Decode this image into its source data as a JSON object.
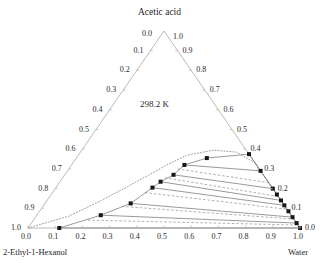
{
  "figure": {
    "type": "ternary-phase-diagram",
    "temperature_label": "298.2 K",
    "apex_label": "Acetic acid",
    "left_corner_label": "2-Ethyl-1-Hexanol",
    "right_corner_label": "Water",
    "apex_tick_left": "0.0",
    "apex_tick_right": "1.0"
  },
  "axes": {
    "left_axis_name": "Acetic acid fraction (left edge)",
    "right_axis_name": "Acetic acid fraction (right edge)",
    "bottom_axis_name": "Water fraction",
    "left_ticks": [
      "0.1",
      "0.2",
      "0.3",
      "0.4",
      "0.5",
      "0.6",
      "0.7",
      "0.8",
      "0.9",
      "1.0"
    ],
    "right_ticks": [
      "0.9",
      "0.8",
      "0.7",
      "0.6",
      "0.5",
      "0.4",
      "0.3",
      "0.2",
      "0.1",
      "0.0"
    ],
    "bottom_ticks": [
      "0.0",
      "0.1",
      "0.2",
      "0.3",
      "0.4",
      "0.5",
      "0.6",
      "0.7",
      "0.8",
      "0.9",
      "1.0"
    ]
  },
  "chart_data": {
    "type": "scatter",
    "title": "",
    "subtitle": "298.2 K",
    "xlabel": "2-Ethyl-1-Hexanol",
    "ylabel": "Acetic acid",
    "zlabel": "Water",
    "components": [
      "2-Ethyl-1-Hexanol",
      "Acetic acid",
      "Water"
    ],
    "axis_range": [
      0.0,
      1.0
    ],
    "grid": false,
    "legend_position": "none",
    "series": [
      {
        "name": "Experimental binodal (left / organic branch)",
        "marker": "filled-square",
        "points": [
          {
            "alcohol": 0.885,
            "acid": 0.0,
            "water": 0.115
          },
          {
            "alcohol": 0.7,
            "acid": 0.065,
            "water": 0.235
          },
          {
            "alcohol": 0.56,
            "acid": 0.125,
            "water": 0.315
          },
          {
            "alcohol": 0.44,
            "acid": 0.205,
            "water": 0.355
          },
          {
            "alcohol": 0.395,
            "acid": 0.235,
            "water": 0.37
          },
          {
            "alcohol": 0.33,
            "acid": 0.27,
            "water": 0.4
          },
          {
            "alcohol": 0.265,
            "acid": 0.32,
            "water": 0.415
          },
          {
            "alcohol": 0.165,
            "acid": 0.355,
            "water": 0.48
          },
          {
            "alcohol": 0.0,
            "acid": 0.375,
            "water": 0.625
          }
        ]
      },
      {
        "name": "Experimental binodal (right / aqueous branch)",
        "marker": "filled-square",
        "points": [
          {
            "alcohol": 0.0,
            "acid": 0.29,
            "water": 0.71
          },
          {
            "alcohol": 0.0,
            "acid": 0.2,
            "water": 0.8
          },
          {
            "alcohol": 0.0,
            "acid": 0.17,
            "water": 0.83
          },
          {
            "alcohol": 0.0,
            "acid": 0.14,
            "water": 0.86
          },
          {
            "alcohol": 0.0,
            "acid": 0.115,
            "water": 0.885
          },
          {
            "alcohol": 0.0,
            "acid": 0.085,
            "water": 0.915
          },
          {
            "alcohol": 0.0,
            "acid": 0.055,
            "water": 0.945
          },
          {
            "alcohol": 0.0,
            "acid": 0.025,
            "water": 0.975
          },
          {
            "alcohol": 0.0,
            "acid": 0.0,
            "water": 1.0
          }
        ]
      }
    ],
    "tie_lines_experimental": [
      {
        "style": "solid",
        "left": {
          "alcohol": 0.885,
          "acid": 0.0,
          "water": 0.115
        },
        "right": {
          "alcohol": 0.0,
          "acid": 0.0,
          "water": 1.0
        }
      },
      {
        "style": "solid",
        "left": {
          "alcohol": 0.7,
          "acid": 0.065,
          "water": 0.235
        },
        "right": {
          "alcohol": 0.0,
          "acid": 0.025,
          "water": 0.975
        }
      },
      {
        "style": "solid",
        "left": {
          "alcohol": 0.56,
          "acid": 0.125,
          "water": 0.315
        },
        "right": {
          "alcohol": 0.0,
          "acid": 0.055,
          "water": 0.945
        }
      },
      {
        "style": "solid",
        "left": {
          "alcohol": 0.44,
          "acid": 0.205,
          "water": 0.355
        },
        "right": {
          "alcohol": 0.0,
          "acid": 0.115,
          "water": 0.885
        }
      },
      {
        "style": "solid",
        "left": {
          "alcohol": 0.395,
          "acid": 0.235,
          "water": 0.37
        },
        "right": {
          "alcohol": 0.0,
          "acid": 0.14,
          "water": 0.86
        }
      },
      {
        "style": "solid",
        "left": {
          "alcohol": 0.33,
          "acid": 0.27,
          "water": 0.4
        },
        "right": {
          "alcohol": 0.0,
          "acid": 0.2,
          "water": 0.8
        }
      },
      {
        "style": "solid",
        "left": {
          "alcohol": 0.265,
          "acid": 0.32,
          "water": 0.415
        },
        "right": {
          "alcohol": 0.0,
          "acid": 0.29,
          "water": 0.71
        }
      }
    ],
    "tie_lines_calculated": [
      {
        "style": "dashed",
        "left": {
          "alcohol": 0.76,
          "acid": 0.04,
          "water": 0.2
        },
        "right": {
          "alcohol": 0.0,
          "acid": 0.015,
          "water": 0.985
        }
      },
      {
        "style": "dashed",
        "left": {
          "alcohol": 0.6,
          "acid": 0.11,
          "water": 0.29
        },
        "right": {
          "alcohol": 0.0,
          "acid": 0.045,
          "water": 0.955
        }
      },
      {
        "style": "dashed",
        "left": {
          "alcohol": 0.48,
          "acid": 0.18,
          "water": 0.34
        },
        "right": {
          "alcohol": 0.0,
          "acid": 0.095,
          "water": 0.905
        }
      },
      {
        "style": "dashed",
        "left": {
          "alcohol": 0.37,
          "acid": 0.255,
          "water": 0.375
        },
        "right": {
          "alcohol": 0.0,
          "acid": 0.16,
          "water": 0.84
        }
      },
      {
        "style": "dashed",
        "left": {
          "alcohol": 0.3,
          "acid": 0.3,
          "water": 0.4
        },
        "right": {
          "alcohol": 0.0,
          "acid": 0.23,
          "water": 0.77
        }
      }
    ],
    "binodal_calculated": {
      "name": "Calculated binodal curve",
      "style": "dotted",
      "points": [
        {
          "alcohol": 1.0,
          "acid": 0.0,
          "water": 0.0
        },
        {
          "alcohol": 0.82,
          "acid": 0.06,
          "water": 0.12
        },
        {
          "alcohol": 0.66,
          "acid": 0.14,
          "water": 0.2
        },
        {
          "alcohol": 0.52,
          "acid": 0.215,
          "water": 0.265
        },
        {
          "alcohol": 0.42,
          "acid": 0.27,
          "water": 0.31
        },
        {
          "alcohol": 0.33,
          "acid": 0.32,
          "water": 0.35
        },
        {
          "alcohol": 0.23,
          "acid": 0.37,
          "water": 0.4
        },
        {
          "alcohol": 0.12,
          "acid": 0.395,
          "water": 0.485
        },
        {
          "alcohol": 0.04,
          "acid": 0.385,
          "water": 0.575
        },
        {
          "alcohol": 0.0,
          "acid": 0.33,
          "water": 0.67
        },
        {
          "alcohol": 0.0,
          "acid": 0.24,
          "water": 0.76
        },
        {
          "alcohol": 0.0,
          "acid": 0.15,
          "water": 0.85
        },
        {
          "alcohol": 0.0,
          "acid": 0.07,
          "water": 0.93
        },
        {
          "alcohol": 0.0,
          "acid": 0.0,
          "water": 1.0
        }
      ]
    }
  },
  "style": {
    "axis_color": "#b9b9b9",
    "marker_color": "#161616",
    "tieline_color": "#6e6e6e",
    "dotted_color": "#9a9a9a",
    "text_color": "#1f1f1f"
  }
}
